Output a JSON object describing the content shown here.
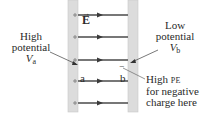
{
  "diagram": {
    "colors": {
      "plate_fill": "#dcdcdc",
      "plate_edge": "#c4c4c4",
      "field_line": "#4a4a4a",
      "text": "#2a2a2a",
      "pointer": "#555555"
    },
    "field_label": "E",
    "field_vector_arrow": "→",
    "left_plate": {
      "charge_sign": "+",
      "count": 5
    },
    "right_plate": {
      "charge_sign": "−"
    },
    "field_lines_count": 5,
    "point_a": "a",
    "point_b": "b",
    "negative_charge": "−",
    "labels": {
      "high_potential": {
        "line1": "High",
        "line2": "potential",
        "symbol": "V",
        "subscript": "a"
      },
      "low_potential": {
        "line1": "Low",
        "line2": "potential",
        "symbol": "V",
        "subscript": "b"
      },
      "high_pe": {
        "line1_a": "High",
        "line1_b": "PE",
        "line2": "for negative",
        "line3": "charge here"
      }
    }
  }
}
